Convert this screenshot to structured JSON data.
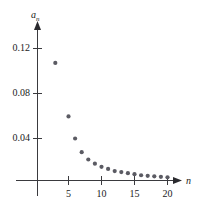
{
  "chart_data": {
    "type": "scatter",
    "title": "",
    "subtitle": "",
    "xlabel": "n",
    "ylabel": "a_n",
    "ylabel_base": "a",
    "ylabel_sub": "n",
    "grid": false,
    "legend": null,
    "xlim": [
      0,
      22
    ],
    "ylim": [
      0,
      0.14
    ],
    "xticks": [
      5,
      10,
      15,
      20
    ],
    "xtick_labels": [
      "5",
      "10",
      "15",
      "20"
    ],
    "yticks": [
      0.04,
      0.08,
      0.12
    ],
    "ytick_labels": [
      "0.04",
      "0.08",
      "0.12"
    ],
    "point_color": "#5b5b63",
    "axis_color": "#3a3a3e",
    "x": [
      3,
      5,
      6,
      7,
      8,
      9,
      10,
      11,
      12,
      13,
      14,
      15,
      16,
      17,
      18,
      19,
      20
    ],
    "y": [
      0.112,
      0.061,
      0.04,
      0.027,
      0.02,
      0.016,
      0.013,
      0.011,
      0.009,
      0.008,
      0.007,
      0.006,
      0.005,
      0.0045,
      0.004,
      0.0035,
      0.003
    ],
    "series": [
      {
        "name": "a_n",
        "x": [
          3,
          5,
          6,
          7,
          8,
          9,
          10,
          11,
          12,
          13,
          14,
          15,
          16,
          17,
          18,
          19,
          20
        ],
        "values": [
          0.112,
          0.061,
          0.04,
          0.027,
          0.02,
          0.016,
          0.013,
          0.011,
          0.009,
          0.008,
          0.007,
          0.006,
          0.005,
          0.0045,
          0.004,
          0.0035,
          0.003
        ]
      }
    ]
  },
  "axes": {
    "x_axis_name": "n",
    "y_axis_name_base": "a",
    "y_axis_name_sub": "n"
  }
}
